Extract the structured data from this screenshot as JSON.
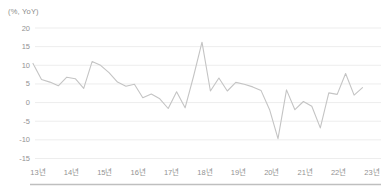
{
  "chart_data": {
    "type": "line",
    "unit_label": "(%, YoY)",
    "title": "",
    "xlabel": "",
    "ylabel": "(%, YoY)",
    "x_tick_labels": [
      "13년",
      "14년",
      "15년",
      "16년",
      "17년",
      "18년",
      "19년",
      "20년",
      "21년",
      "22년",
      "23년"
    ],
    "y_ticks": [
      20,
      15,
      10,
      5,
      0,
      -5,
      -10,
      -15
    ],
    "ylim": [
      -15,
      20
    ],
    "grid": "horizontal",
    "legend_position": "none",
    "points_per_year": 4,
    "x_start_year": 2013,
    "series": [
      {
        "name": "yoy-growth-percent",
        "values": [
          10.5,
          6.2,
          5.5,
          4.5,
          6.8,
          6.4,
          3.8,
          11.0,
          10.0,
          8.0,
          5.5,
          4.4,
          4.9,
          1.3,
          2.3,
          1.0,
          -1.6,
          2.9,
          -1.4,
          7.0,
          16.2,
          3.1,
          6.6,
          3.1,
          5.4,
          4.9,
          4.2,
          3.2,
          -1.9,
          -9.7,
          3.4,
          -1.9,
          0.3,
          -1.0,
          -6.8,
          2.6,
          2.2,
          7.8,
          2.0,
          4.0
        ]
      }
    ],
    "colors": {
      "line": "#c4c4c4",
      "grid": "#ededed",
      "tick_text": "#929292",
      "unit_text": "#8a8a8a",
      "separator": "#bfbfbf",
      "background": "#ffffff"
    }
  }
}
